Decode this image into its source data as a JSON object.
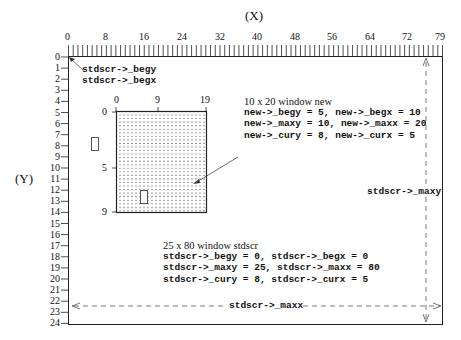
{
  "axes": {
    "x_label": "(X)",
    "y_label": "(Y)",
    "x_ticks": [
      "0",
      "8",
      "16",
      "24",
      "32",
      "40",
      "48",
      "56",
      "64",
      "72",
      "79"
    ],
    "y_ticks": [
      "0",
      "1",
      "2",
      "3",
      "4",
      "5",
      "6",
      "7",
      "8",
      "9",
      "10",
      "11",
      "12",
      "13",
      "14",
      "15",
      "16",
      "17",
      "18",
      "19",
      "20",
      "21",
      "22",
      "23",
      "24"
    ]
  },
  "stdscr": {
    "begy_label": "stdscr->_begy",
    "begx_label": "stdscr->_begx",
    "maxy_label": "stdscr->_maxy",
    "maxx_label": "stdscr->_maxx",
    "info": [
      "25 x 80 window stdscr",
      "stdscr->_begy = 0, stdscr->_begx = 0",
      "stdscr->_maxy = 25, stdscr->_maxx = 80",
      "stdscr->_cury = 8, stdscr->_curx = 5"
    ]
  },
  "new_window": {
    "x_ticks": [
      "0",
      "9",
      "19"
    ],
    "y_ticks": [
      "0",
      "5",
      "9"
    ],
    "info": [
      "10 x 20 window new",
      "new->_begy = 5, new->_begx = 10",
      "new->_maxy = 10, new->_maxx = 20",
      "new->_cury = 8, new->_curx = 5"
    ]
  },
  "cursor_glyph": "▯"
}
